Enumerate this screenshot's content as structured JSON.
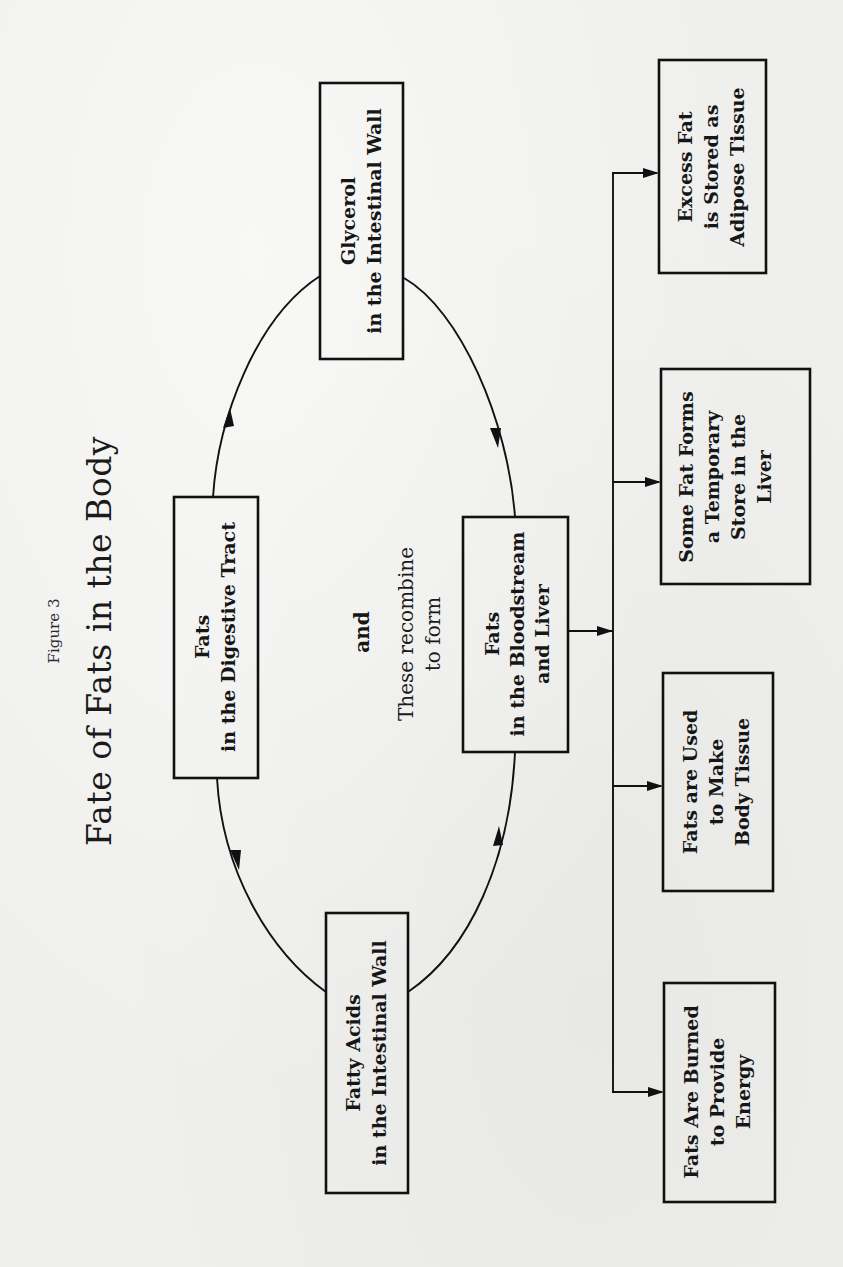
{
  "figure": {
    "label": "Figure 3",
    "title": "Fate of Fats in the Body"
  },
  "nodes": {
    "digestive": {
      "line1": "Fats",
      "line2": "in the Digestive Tract"
    },
    "glycerol": {
      "line1": "Glycerol",
      "line2": "in the Intestinal Wall"
    },
    "fatty_acids": {
      "line1": "Fatty Acids",
      "line2": "in the Intestinal Wall"
    },
    "bloodstream": {
      "line1": "Fats",
      "line2": "in the Bloodstream",
      "line3": "and Liver"
    },
    "adipose": {
      "line1": "Excess Fat",
      "line2": "is Stored as",
      "line3": "Adipose Tissue"
    },
    "liver_store": {
      "line1": "Some Fat Forms",
      "line2": "a Temporary",
      "line3": "Store in the",
      "line4": "Liver"
    },
    "body_tissue": {
      "line1": "Fats are Used",
      "line2": "to Make",
      "line3": "Body Tissue"
    },
    "energy": {
      "line1": "Fats Are Burned",
      "line2": "to Provide",
      "line3": "Energy"
    }
  },
  "annotations": {
    "and": "and",
    "recombine_line1": "These recombine",
    "recombine_line2": "to form"
  },
  "edges": [
    {
      "from": "Fats in the Digestive Tract",
      "to": "Glycerol in the Intestinal Wall"
    },
    {
      "from": "Fats in the Digestive Tract",
      "to": "Fatty Acids in the Intestinal Wall"
    },
    {
      "from": "Glycerol in the Intestinal Wall",
      "to": "Fats in the Bloodstream and Liver"
    },
    {
      "from": "Fatty Acids in the Intestinal Wall",
      "to": "Fats in the Bloodstream and Liver"
    },
    {
      "from": "Fats in the Bloodstream and Liver",
      "to": "Excess Fat is Stored as Adipose Tissue"
    },
    {
      "from": "Fats in the Bloodstream and Liver",
      "to": "Some Fat Forms a Temporary Store in the Liver"
    },
    {
      "from": "Fats in the Bloodstream and Liver",
      "to": "Fats are Used to Make Body Tissue"
    },
    {
      "from": "Fats in the Bloodstream and Liver",
      "to": "Fats Are Burned to Provide Energy"
    }
  ],
  "colors": {
    "paper": "#efefed",
    "ink": "#111111"
  }
}
